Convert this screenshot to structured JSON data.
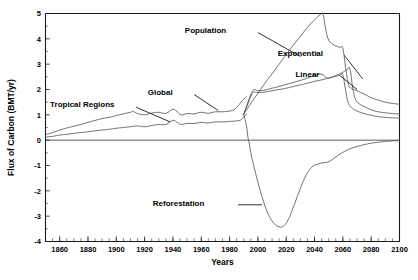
{
  "chart_data": {
    "type": "line",
    "title": "",
    "xlabel": "Years",
    "ylabel": "Flux of Carbon  (BMT/yr)",
    "xlim": [
      1850,
      2100
    ],
    "ylim": [
      -4,
      5
    ],
    "xticks": [
      1860,
      1880,
      1900,
      1920,
      1940,
      1960,
      1980,
      2000,
      2020,
      2040,
      2060,
      2080,
      2100
    ],
    "xtick_labels": [
      "1860",
      "1880",
      "1900",
      "1920",
      "1940",
      "1960",
      "1980",
      "2000",
      "2020",
      "2040",
      "2060",
      "2080",
      "2100"
    ],
    "yticks": [
      5,
      4,
      3,
      2,
      1,
      0,
      -1,
      -2,
      -3,
      -4
    ],
    "ytick_labels": [
      "5",
      "4",
      "3",
      "2",
      "1",
      "0",
      "-1",
      "-2",
      "-3",
      "-4"
    ],
    "minor_tick_interval": 5,
    "grid": false,
    "legend_position": "inline-annotations",
    "series": [
      {
        "name": "Tropical Regions",
        "label": "Tropical Regions",
        "label_x": 1876,
        "label_y": 1.42,
        "leader_from": [
          1914,
          1.3
        ],
        "leader_to": [
          1938,
          0.72
        ],
        "points": [
          [
            1850,
            0.12
          ],
          [
            1855,
            0.15
          ],
          [
            1860,
            0.2
          ],
          [
            1865,
            0.23
          ],
          [
            1870,
            0.27
          ],
          [
            1875,
            0.3
          ],
          [
            1880,
            0.33
          ],
          [
            1885,
            0.37
          ],
          [
            1890,
            0.4
          ],
          [
            1895,
            0.43
          ],
          [
            1900,
            0.47
          ],
          [
            1905,
            0.5
          ],
          [
            1910,
            0.53
          ],
          [
            1915,
            0.56
          ],
          [
            1920,
            0.53
          ],
          [
            1925,
            0.58
          ],
          [
            1930,
            0.62
          ],
          [
            1935,
            0.62
          ],
          [
            1940,
            0.78
          ],
          [
            1943,
            0.7
          ],
          [
            1946,
            0.62
          ],
          [
            1950,
            0.66
          ],
          [
            1955,
            0.66
          ],
          [
            1960,
            0.7
          ],
          [
            1965,
            0.68
          ],
          [
            1970,
            0.72
          ],
          [
            1975,
            0.72
          ],
          [
            1980,
            0.74
          ],
          [
            1985,
            0.76
          ],
          [
            1988,
            0.8
          ],
          [
            1990,
            0.92
          ],
          [
            1992,
            1.02
          ]
        ]
      },
      {
        "name": "Global",
        "label": "Global",
        "label_x": 1931,
        "label_y": 1.9,
        "leader_from": [
          1955,
          1.8
        ],
        "leader_to": [
          1972,
          1.17
        ],
        "points": [
          [
            1850,
            0.22
          ],
          [
            1855,
            0.3
          ],
          [
            1860,
            0.4
          ],
          [
            1865,
            0.48
          ],
          [
            1870,
            0.55
          ],
          [
            1875,
            0.62
          ],
          [
            1880,
            0.7
          ],
          [
            1885,
            0.78
          ],
          [
            1890,
            0.85
          ],
          [
            1895,
            0.9
          ],
          [
            1900,
            0.97
          ],
          [
            1905,
            1.04
          ],
          [
            1910,
            1.1
          ],
          [
            1912,
            1.13
          ],
          [
            1915,
            1.05
          ],
          [
            1920,
            1.0
          ],
          [
            1925,
            1.07
          ],
          [
            1930,
            1.1
          ],
          [
            1935,
            1.06
          ],
          [
            1940,
            1.22
          ],
          [
            1943,
            1.12
          ],
          [
            1946,
            1.0
          ],
          [
            1950,
            1.05
          ],
          [
            1955,
            1.04
          ],
          [
            1960,
            1.1
          ],
          [
            1965,
            1.06
          ],
          [
            1970,
            1.12
          ],
          [
            1975,
            1.12
          ],
          [
            1980,
            1.15
          ],
          [
            1983,
            1.2
          ],
          [
            1986,
            1.35
          ],
          [
            1988,
            1.5
          ],
          [
            1990,
            1.62
          ],
          [
            1992,
            1.72
          ]
        ]
      },
      {
        "name": "Population",
        "label": "Population",
        "label_x": 1963,
        "label_y": 4.35,
        "leader_from": [
          2000,
          4.25
        ],
        "leader_to": [
          2030,
          3.3
        ],
        "points": [
          [
            1990,
            1.02
          ],
          [
            1992,
            1.2
          ],
          [
            1995,
            1.45
          ],
          [
            2000,
            1.85
          ],
          [
            2005,
            2.25
          ],
          [
            2010,
            2.62
          ],
          [
            2015,
            3.0
          ],
          [
            2020,
            3.38
          ],
          [
            2025,
            3.75
          ],
          [
            2030,
            4.1
          ],
          [
            2035,
            4.45
          ],
          [
            2040,
            4.75
          ],
          [
            2044,
            4.95
          ],
          [
            2046,
            4.97
          ],
          [
            2048,
            4.35
          ],
          [
            2050,
            3.95
          ],
          [
            2053,
            3.78
          ],
          [
            2056,
            3.7
          ],
          [
            2058,
            3.66
          ],
          [
            2060,
            3.62
          ],
          [
            2062,
            2.85
          ],
          [
            2064,
            2.2
          ],
          [
            2066,
            2.05
          ],
          [
            2070,
            1.95
          ],
          [
            2075,
            1.82
          ],
          [
            2080,
            1.68
          ],
          [
            2085,
            1.58
          ],
          [
            2090,
            1.5
          ],
          [
            2095,
            1.45
          ],
          [
            2100,
            1.42
          ]
        ]
      },
      {
        "name": "Exponential",
        "label": "Exponential",
        "label_x": 2030,
        "label_y": 3.45,
        "leader_from": [
          2061,
          3.35
        ],
        "leader_to": [
          2074,
          2.42
        ],
        "points": [
          [
            1990,
            1.02
          ],
          [
            1993,
            1.5
          ],
          [
            1996,
            1.92
          ],
          [
            1998,
            2.0
          ],
          [
            2000,
            1.95
          ],
          [
            2005,
            1.98
          ],
          [
            2010,
            2.05
          ],
          [
            2015,
            2.12
          ],
          [
            2020,
            2.2
          ],
          [
            2025,
            2.28
          ],
          [
            2030,
            2.36
          ],
          [
            2035,
            2.45
          ],
          [
            2040,
            2.55
          ],
          [
            2045,
            2.6
          ],
          [
            2048,
            2.48
          ],
          [
            2050,
            2.45
          ],
          [
            2055,
            2.55
          ],
          [
            2060,
            2.68
          ],
          [
            2063,
            2.78
          ],
          [
            2065,
            2.8
          ],
          [
            2067,
            2.05
          ],
          [
            2069,
            1.6
          ],
          [
            2072,
            1.42
          ],
          [
            2075,
            1.33
          ],
          [
            2080,
            1.2
          ],
          [
            2085,
            1.12
          ],
          [
            2090,
            1.08
          ],
          [
            2095,
            1.05
          ],
          [
            2100,
            1.03
          ]
        ]
      },
      {
        "name": "Linear",
        "label": "Linear",
        "label_x": 2035,
        "label_y": 2.62,
        "leader_from": [
          2058,
          2.55
        ],
        "leader_to": [
          2070,
          2.0
        ],
        "points": [
          [
            1990,
            1.02
          ],
          [
            1993,
            1.45
          ],
          [
            1996,
            1.85
          ],
          [
            1998,
            1.9
          ],
          [
            2000,
            1.88
          ],
          [
            2005,
            1.9
          ],
          [
            2010,
            1.95
          ],
          [
            2015,
            2.0
          ],
          [
            2020,
            2.05
          ],
          [
            2025,
            2.12
          ],
          [
            2030,
            2.18
          ],
          [
            2035,
            2.25
          ],
          [
            2040,
            2.32
          ],
          [
            2045,
            2.38
          ],
          [
            2050,
            2.45
          ],
          [
            2055,
            2.52
          ],
          [
            2058,
            2.56
          ],
          [
            2060,
            2.58
          ],
          [
            2062,
            1.95
          ],
          [
            2064,
            1.45
          ],
          [
            2067,
            1.25
          ],
          [
            2070,
            1.15
          ],
          [
            2075,
            1.05
          ],
          [
            2080,
            0.98
          ],
          [
            2085,
            0.93
          ],
          [
            2090,
            0.9
          ],
          [
            2095,
            0.88
          ],
          [
            2100,
            0.87
          ]
        ]
      },
      {
        "name": "Reforestation",
        "label": "Reforestation",
        "label_x": 1944,
        "label_y": -2.48,
        "leader_from": [
          1986,
          -2.55
        ],
        "leader_to": [
          2003,
          -2.55
        ],
        "points": [
          [
            1990,
            1.0
          ],
          [
            1992,
            0.55
          ],
          [
            1993,
            0.1
          ],
          [
            1994,
            -0.15
          ],
          [
            1995,
            -0.5
          ],
          [
            1997,
            -1.0
          ],
          [
            2000,
            -1.65
          ],
          [
            2003,
            -2.25
          ],
          [
            2006,
            -2.75
          ],
          [
            2009,
            -3.1
          ],
          [
            2012,
            -3.32
          ],
          [
            2015,
            -3.42
          ],
          [
            2018,
            -3.4
          ],
          [
            2021,
            -3.18
          ],
          [
            2024,
            -2.8
          ],
          [
            2027,
            -2.35
          ],
          [
            2030,
            -1.9
          ],
          [
            2033,
            -1.5
          ],
          [
            2036,
            -1.2
          ],
          [
            2039,
            -1.02
          ],
          [
            2042,
            -0.95
          ],
          [
            2045,
            -0.9
          ],
          [
            2048,
            -0.88
          ],
          [
            2051,
            -0.82
          ],
          [
            2054,
            -0.7
          ],
          [
            2058,
            -0.55
          ],
          [
            2062,
            -0.42
          ],
          [
            2066,
            -0.32
          ],
          [
            2070,
            -0.25
          ],
          [
            2075,
            -0.18
          ],
          [
            2080,
            -0.12
          ],
          [
            2085,
            -0.08
          ],
          [
            2090,
            -0.05
          ],
          [
            2095,
            -0.03
          ],
          [
            2100,
            -0.02
          ]
        ]
      }
    ]
  }
}
